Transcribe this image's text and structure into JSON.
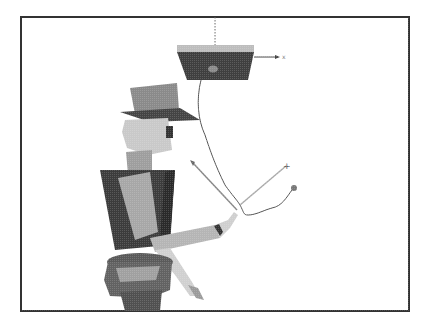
{
  "figure": {
    "frame": {
      "x": 21,
      "y": 17,
      "width": 388,
      "height": 294,
      "border_color": "#333333"
    },
    "background": "#ffffff",
    "elements": {
      "ceiling_line": "dotted vertical line from frame top",
      "lamp": "trapezoidal hanging object with arrow axis",
      "lamp_axis_label": "x",
      "figure": "articulated 3D character with top hat",
      "motion_path": "wavy trajectory curve",
      "target_markers": [
        "+",
        "o",
        "arrow"
      ]
    },
    "colors": {
      "dark": "#3a3a3a",
      "mid": "#6e6e6e",
      "light": "#b8b8b8",
      "lighter": "#d4d4d4",
      "line": "#555555"
    }
  }
}
